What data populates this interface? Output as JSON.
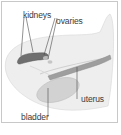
{
  "diagram": {
    "labels": {
      "kidneys": "kidneys",
      "ovaries": "ovaries",
      "uterus": "uterus",
      "bladder": "bladder"
    },
    "colors": {
      "border": "#c8c8c8",
      "body_fill": "#ececec",
      "kidney_fill": "#7a7a7a",
      "uterus_fill": "#9a9a9a",
      "bladder_fill": "#cfcfcf",
      "leader_line": "#4a4a4a",
      "text": "#3a3a3a"
    }
  }
}
